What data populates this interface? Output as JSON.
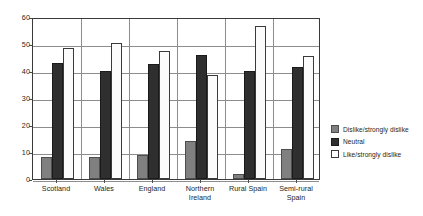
{
  "chart_data": {
    "type": "bar",
    "title": "",
    "subtitle": "",
    "xlabel": "",
    "ylabel": "",
    "ylim": [
      0,
      60
    ],
    "yticks": [
      0,
      10,
      20,
      30,
      40,
      50,
      60
    ],
    "ytick_labels": [
      "0",
      "10",
      "20",
      "30",
      "40",
      "50",
      "60"
    ],
    "grid": true,
    "legend_position": "right",
    "categories": [
      "Scotland",
      "Wales",
      "England",
      "Northern Ireland",
      "Rural Spain",
      "Semi-rural Spain"
    ],
    "series": [
      {
        "name": "Dislike/strongly dislike",
        "color": "#808080",
        "values": [
          8,
          8,
          9,
          14,
          2,
          11
        ]
      },
      {
        "name": "Neutral",
        "color": "#2f2f2f",
        "values": [
          43,
          40,
          42.5,
          46,
          40,
          41.5
        ]
      },
      {
        "name": "Like/strongly dislike",
        "color": "#ffffff",
        "values": [
          48.5,
          50.5,
          47.5,
          38.5,
          56.5,
          45.5
        ]
      }
    ]
  },
  "legend": {
    "items": [
      {
        "label": "Dislike/strongly dislike",
        "swatch": "gray"
      },
      {
        "label": "Neutral",
        "swatch": "dark"
      },
      {
        "label": "Like/strongly dislike",
        "swatch": "white"
      }
    ]
  }
}
